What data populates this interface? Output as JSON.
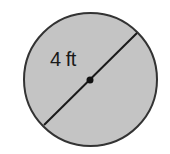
{
  "diagram": {
    "type": "circle-with-diameter",
    "diameter_label": "4 ft",
    "colors": {
      "fill": "#c4c4c4",
      "stroke": "#333333",
      "center_dot": "#111111",
      "background": "#ffffff"
    }
  }
}
